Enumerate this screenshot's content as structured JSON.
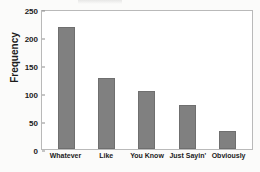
{
  "chart_data": {
    "type": "bar",
    "title": "",
    "xlabel": "",
    "ylabel": "Frequency",
    "categories": [
      "Whatever",
      "Like",
      "You Know",
      "Just Sayin'",
      "Obviously"
    ],
    "values": [
      218,
      127,
      103,
      79,
      33
    ],
    "ylim": [
      0,
      250
    ],
    "yticks": [
      0,
      50,
      100,
      150,
      200,
      250
    ],
    "ytick_labels": [
      "0",
      "50",
      "100",
      "150",
      "200",
      "250"
    ],
    "grid": false,
    "legend": false,
    "bar_color": "#808080",
    "frame_color": "#b9b9b9",
    "background": "#ffffff",
    "page_background": "#fbfbfa"
  }
}
